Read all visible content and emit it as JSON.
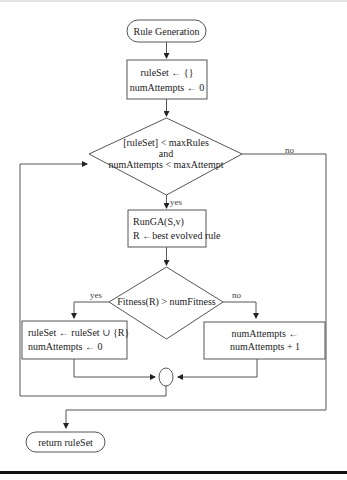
{
  "diagram": {
    "type": "flowchart",
    "start": {
      "label": "Rule Generation"
    },
    "init": {
      "lines": [
        "ruleSet ← {}",
        "numAttempts ← 0"
      ]
    },
    "loop_condition": {
      "lines": [
        "[ruleSet] < maxRules",
        "and",
        "numAttempts < maxAttempt"
      ],
      "yes_label": "yes",
      "no_label": "no"
    },
    "run_ga": {
      "lines": [
        "RunGA(S,v)",
        "R ←best evolved rule"
      ]
    },
    "fitness_condition": {
      "label": "Fitness(R) > numFitness",
      "yes_label": "yes",
      "no_label": "no"
    },
    "add_rule": {
      "lines": [
        "ruleSet ← ruleSet ∪ {R}",
        "numAttempts ← 0"
      ]
    },
    "increment": {
      "lines": [
        "numAttempts ←",
        "numAttempts + 1"
      ]
    },
    "end": {
      "label": "return ruleSet"
    }
  }
}
